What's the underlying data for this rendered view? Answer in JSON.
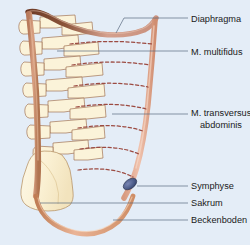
{
  "figure": {
    "background_color": "#e4edf7",
    "labels": [
      {
        "id": "diaphragma",
        "text": "Diaphragma",
        "x": 191,
        "y": 22
      },
      {
        "id": "multifidus",
        "text": "M. multifidus",
        "x": 191,
        "y": 55
      },
      {
        "id": "transversus1",
        "text": "M. transversus",
        "x": 191,
        "y": 116
      },
      {
        "id": "transversus2",
        "text": "abdominis",
        "x": 200,
        "y": 128
      },
      {
        "id": "symphyse",
        "text": "Symphyse",
        "x": 191,
        "y": 189
      },
      {
        "id": "sakrum",
        "text": "Sakrum",
        "x": 191,
        "y": 206
      },
      {
        "id": "beckenboden",
        "text": "Beckenboden",
        "x": 191,
        "y": 223
      }
    ],
    "structures": [
      {
        "id": "diaphragm",
        "name": "Diaphragma",
        "color": "#8a5338"
      },
      {
        "id": "multifidus-band",
        "name": "M. multifidus",
        "color": "#c98f72"
      },
      {
        "id": "transversus-band",
        "name": "M. transversus abdominis",
        "color": "#e0a089"
      },
      {
        "id": "vertebrae",
        "name": "Lendenwirbel",
        "color": "#fbf3d9"
      },
      {
        "id": "sacrum",
        "name": "Sakrum",
        "color": "#fbf3d9"
      },
      {
        "id": "symphysis",
        "name": "Symphyse",
        "color": "#4a5a86"
      },
      {
        "id": "pelvic-floor",
        "name": "Beckenboden",
        "color": "#dd9a74"
      },
      {
        "id": "fascia-lines",
        "name": "Faszienlinien",
        "color": "#9c4b42"
      }
    ]
  }
}
